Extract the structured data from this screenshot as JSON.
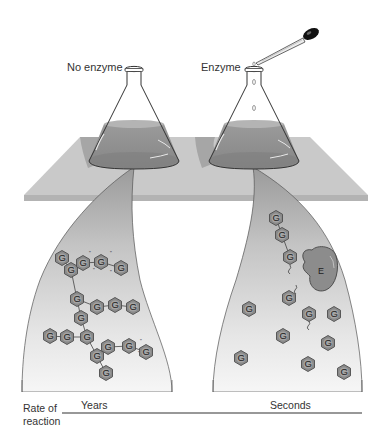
{
  "figure": {
    "flask_left_label": "No enzyme",
    "flask_right_label": "Enzyme",
    "enzyme_label": "E",
    "monomer_label": "G",
    "axis_label_line1": "Rate of",
    "axis_label_line2": "reaction",
    "rate_left": "Years",
    "rate_right": "Seconds"
  },
  "colors": {
    "background": "#ffffff",
    "table": "#c8c8c8",
    "table_edge": "#b0b0b0",
    "liquid": "#8e8e8e",
    "funnel_top": "#9a9a9a",
    "funnel_bottom": "#f4f4f4",
    "hexagon_fill": "#8a8a8a",
    "hexagon_stroke": "#555555",
    "enzyme_fill": "#8c8c8c",
    "text": "#333333"
  },
  "left_panel": {
    "description": "Glycogen: branched polymer of G units (intact, slow hydrolysis)",
    "units": [
      [
        62,
        258
      ],
      [
        71,
        270
      ],
      [
        83,
        263
      ],
      [
        101,
        262
      ],
      [
        121,
        268
      ],
      [
        77,
        299
      ],
      [
        81,
        318
      ],
      [
        97,
        307
      ],
      [
        115,
        305
      ],
      [
        133,
        307
      ],
      [
        50,
        336
      ],
      [
        67,
        337
      ],
      [
        87,
        337
      ],
      [
        97,
        356
      ],
      [
        108,
        347
      ],
      [
        129,
        346
      ],
      [
        146,
        352
      ],
      [
        106,
        373
      ]
    ]
  },
  "right_panel": {
    "description": "Enzyme E cleaving G units rapidly",
    "chain_units": [
      [
        276,
        218
      ],
      [
        282,
        235
      ],
      [
        290,
        257
      ],
      [
        289,
        298
      ]
    ],
    "free_units": [
      [
        249,
        309
      ],
      [
        309,
        314
      ],
      [
        334,
        314
      ],
      [
        283,
        336
      ],
      [
        328,
        343
      ],
      [
        241,
        358
      ],
      [
        308,
        364
      ],
      [
        344,
        372
      ]
    ]
  }
}
